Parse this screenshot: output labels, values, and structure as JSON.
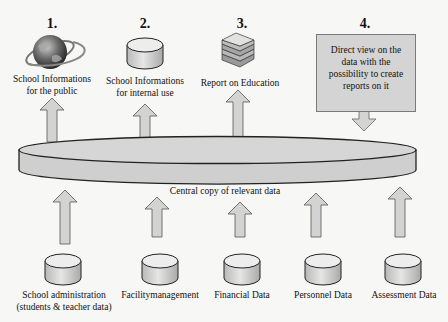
{
  "colors": {
    "fill": "#d0d0d0",
    "stroke": "#222222",
    "callout_fill": "#d4d4d4",
    "background": "#f7f7f5"
  },
  "outputs": [
    {
      "number": "1.",
      "icon": "globe-icon",
      "label_lines": [
        "School Informations",
        "for the public"
      ]
    },
    {
      "number": "2.",
      "icon": "database-icon",
      "label_lines": [
        "School Informations",
        "for internal use"
      ]
    },
    {
      "number": "3.",
      "icon": "books-icon",
      "label_lines": [
        "Report on Education"
      ]
    },
    {
      "number": "4.",
      "icon": "callout-box",
      "label_lines": [
        "Direct view on the",
        "data with the",
        "possibility to create",
        "reports on it"
      ]
    }
  ],
  "central": {
    "label": "Central copy of relevant data"
  },
  "sources": [
    {
      "label_lines": [
        "School administration",
        "(students & teacher data)"
      ]
    },
    {
      "label_lines": [
        "Facilitymanagement"
      ]
    },
    {
      "label_lines": [
        "Financial Data"
      ]
    },
    {
      "label_lines": [
        "Personnel Data"
      ]
    },
    {
      "label_lines": [
        "Assessment Data"
      ]
    }
  ]
}
